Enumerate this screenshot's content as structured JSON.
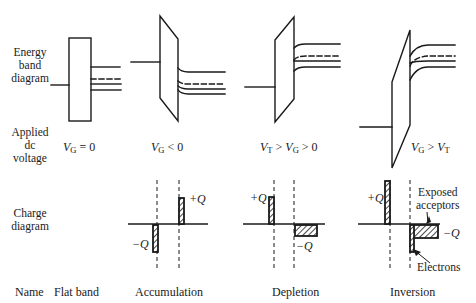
{
  "row_labels": {
    "energy": [
      "Energy",
      "band",
      "diagram"
    ],
    "voltage": [
      "Applied",
      "dc",
      "voltage"
    ],
    "charge": [
      "Charge",
      "diagram"
    ],
    "name": "Name"
  },
  "columns": [
    {
      "name": "Flat band",
      "voltage": {
        "a": "V",
        "a_sub": "G",
        "op1": " = 0",
        "b": "",
        "b_sub": "",
        "op2": ""
      },
      "charge": null
    },
    {
      "name": "Accumulation",
      "voltage": {
        "a": "V",
        "a_sub": "G",
        "op1": " < 0",
        "b": "",
        "b_sub": "",
        "op2": ""
      },
      "charge": {
        "plus_label": "+Q",
        "minus_label": "−Q"
      }
    },
    {
      "name": "Depletion",
      "voltage": {
        "a": "V",
        "a_sub": "T",
        "op1": " > ",
        "b": "V",
        "b_sub": "G",
        "op2": " > 0"
      },
      "charge": {
        "plus_label": "+Q",
        "minus_label": "−Q"
      }
    },
    {
      "name": "Inversion",
      "voltage": {
        "a": "V",
        "a_sub": "G",
        "op1": " > ",
        "b": "V",
        "b_sub": "T",
        "op2": ""
      },
      "charge": {
        "plus_label": "+Q",
        "minus_label": "−Q",
        "annotation_acceptors": [
          "Exposed",
          "acceptors"
        ],
        "annotation_electrons": "Electrons"
      }
    }
  ],
  "colors": {
    "ink": "#1a1a1a",
    "background": "#ffffff"
  }
}
